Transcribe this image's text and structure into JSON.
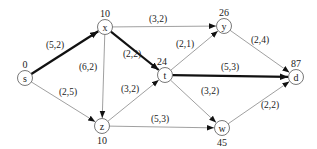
{
  "diagram": {
    "type": "directed-graph",
    "nodes": [
      {
        "id": "s",
        "label": "s",
        "value": "0",
        "x": 25,
        "y": 78,
        "value_pos": "above"
      },
      {
        "id": "x",
        "label": "x",
        "value": "10",
        "x": 105,
        "y": 27,
        "value_pos": "above"
      },
      {
        "id": "z",
        "label": "z",
        "value": "10",
        "x": 102,
        "y": 126,
        "value_pos": "below"
      },
      {
        "id": "t",
        "label": "t",
        "value": "24",
        "x": 165,
        "y": 75,
        "value_pos": "above-left"
      },
      {
        "id": "y",
        "label": "y",
        "value": "26",
        "x": 224,
        "y": 26,
        "value_pos": "above"
      },
      {
        "id": "w",
        "label": "w",
        "value": "45",
        "x": 222,
        "y": 128,
        "value_pos": "below"
      },
      {
        "id": "d",
        "label": "d",
        "value": "87",
        "x": 296,
        "y": 77,
        "value_pos": "above"
      }
    ],
    "edges": [
      {
        "from": "s",
        "to": "x",
        "label": "(5,2)",
        "bold": true,
        "lx": 55,
        "ly": 48
      },
      {
        "from": "s",
        "to": "z",
        "label": "(2,5)",
        "bold": false,
        "lx": 68,
        "ly": 95
      },
      {
        "from": "x",
        "to": "y",
        "label": "(3,2)",
        "bold": false,
        "lx": 158,
        "ly": 22
      },
      {
        "from": "x",
        "to": "t",
        "label": "(2,2)",
        "bold": true,
        "lx": 132,
        "ly": 57
      },
      {
        "from": "x",
        "to": "z",
        "label": "(6,2)",
        "bold": false,
        "lx": 88,
        "ly": 70
      },
      {
        "from": "z",
        "to": "t",
        "label": "(3,2)",
        "bold": false,
        "lx": 130,
        "ly": 92
      },
      {
        "from": "z",
        "to": "w",
        "label": "(5,3)",
        "bold": false,
        "lx": 160,
        "ly": 122
      },
      {
        "from": "t",
        "to": "y",
        "label": "(2,1)",
        "bold": false,
        "lx": 185,
        "ly": 47
      },
      {
        "from": "t",
        "to": "d",
        "label": "(5,3)",
        "bold": true,
        "lx": 230,
        "ly": 70
      },
      {
        "from": "t",
        "to": "w",
        "label": "(3,2)",
        "bold": false,
        "lx": 210,
        "ly": 94
      },
      {
        "from": "y",
        "to": "d",
        "label": "(2,4)",
        "bold": false,
        "lx": 260,
        "ly": 43
      },
      {
        "from": "w",
        "to": "d",
        "label": "(2,2)",
        "bold": false,
        "lx": 270,
        "ly": 108
      }
    ]
  }
}
